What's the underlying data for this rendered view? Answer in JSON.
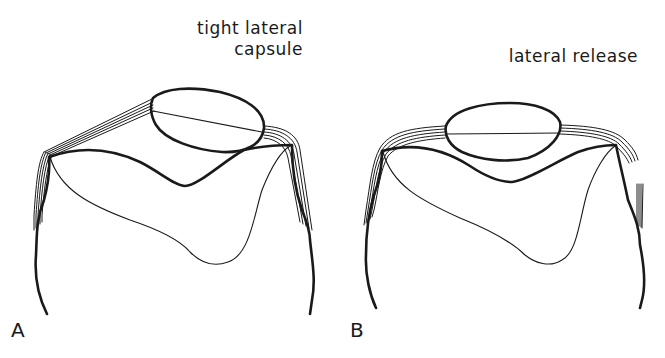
{
  "figure": {
    "panels": [
      {
        "letter": "A",
        "caption_lines": [
          "tight lateral",
          "capsule"
        ]
      },
      {
        "letter": "B",
        "caption_lines": [
          "lateral release"
        ]
      }
    ],
    "colors": {
      "line": "#1a1a1a",
      "background": "#ffffff"
    }
  }
}
